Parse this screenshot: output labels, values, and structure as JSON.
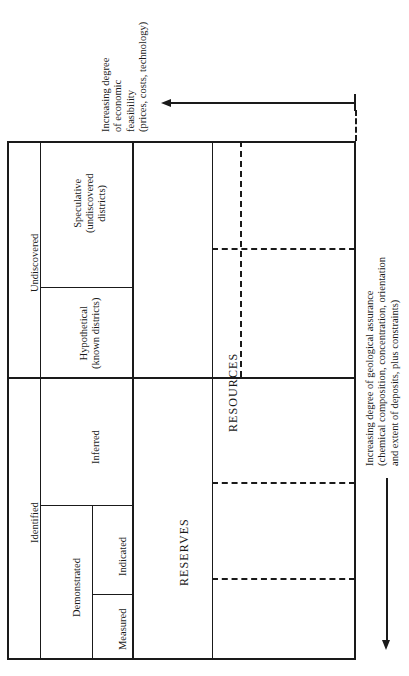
{
  "diagram": {
    "top_axis": {
      "label_lines": [
        "Increasing degree",
        "of economic",
        "feasibility",
        "(prices, costs, technology)"
      ],
      "arrow_direction": "left",
      "arrow_name": "economic-feasibility-arrow"
    },
    "right_axis": {
      "label_lines": [
        "Increasing degree of geological assurance",
        "(chemical composition, concentration, orientation",
        "and extent of deposits, plus constraints)"
      ],
      "arrow_direction": "down",
      "arrow_name": "geological-assurance-arrow"
    },
    "row_groups": [
      {
        "name": "undiscovered",
        "label": "Undiscovered",
        "subcells": [
          {
            "name": "speculative",
            "lines": [
              "Speculative",
              "(undiscovered",
              "districts)"
            ]
          },
          {
            "name": "hypothetical",
            "lines": [
              "Hypothetical",
              "(known districts)"
            ]
          }
        ]
      },
      {
        "name": "identified",
        "label": "Identified",
        "subcells": [
          {
            "name": "inferred",
            "lines": [
              "Inferred"
            ]
          },
          {
            "name": "demonstrated",
            "lines": [
              "Demonstrated"
            ],
            "children": [
              {
                "name": "indicated",
                "lines": [
                  "Indicated"
                ]
              },
              {
                "name": "measured",
                "lines": [
                  "Measured"
                ]
              }
            ]
          }
        ]
      }
    ],
    "economic_bands": [
      {
        "name": "reserves",
        "label": "RESERVES"
      },
      {
        "name": "resources",
        "label": "RESOURCES"
      }
    ]
  }
}
